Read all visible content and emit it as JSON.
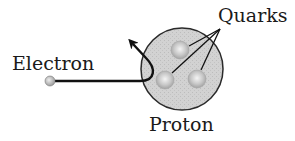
{
  "diagram": {
    "labels": {
      "electron": "Electron",
      "quarks": "Quarks",
      "proton": "Proton"
    },
    "colors": {
      "proton_fill": "#cfcfcf",
      "proton_stroke": "#2a2a2a",
      "quark_fill": "#bdbdbd",
      "quark_highlight": "#f2f2f2",
      "electron_fill": "#b5b5b5",
      "line": "#111111"
    },
    "elements": {
      "proton": {
        "cx": 182,
        "cy": 69,
        "r": 41
      },
      "quarks": [
        {
          "cx": 180,
          "cy": 50,
          "r": 9
        },
        {
          "cx": 165,
          "cy": 80,
          "r": 9
        },
        {
          "cx": 197,
          "cy": 79,
          "r": 9
        }
      ],
      "electron": {
        "cx": 50,
        "cy": 81,
        "r": 5
      }
    }
  }
}
